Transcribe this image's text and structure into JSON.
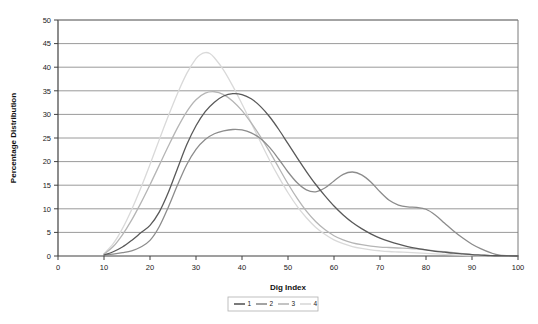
{
  "chart_data": {
    "type": "line",
    "title": "",
    "xlabel": "Dig Index",
    "ylabel": "Percentage Distribution",
    "xlim": [
      0,
      100
    ],
    "ylim": [
      0,
      50
    ],
    "xticks": [
      0,
      10,
      20,
      30,
      40,
      50,
      60,
      70,
      80,
      90,
      100
    ],
    "yticks": [
      0,
      5,
      10,
      15,
      20,
      25,
      30,
      35,
      40,
      45,
      50
    ],
    "grid": "horizontal",
    "legend_position": "bottom-center",
    "series": [
      {
        "name": "1",
        "color": "#595959",
        "points": [
          [
            10,
            0.2
          ],
          [
            12,
            0.9
          ],
          [
            14,
            1.9
          ],
          [
            16,
            3.3
          ],
          [
            18,
            4.9
          ],
          [
            20,
            6.5
          ],
          [
            22,
            9.3
          ],
          [
            24,
            13.5
          ],
          [
            26,
            18.6
          ],
          [
            28,
            23.6
          ],
          [
            30,
            27.6
          ],
          [
            32,
            30.6
          ],
          [
            34,
            32.6
          ],
          [
            36,
            33.9
          ],
          [
            38,
            34.4
          ],
          [
            40,
            34.2
          ],
          [
            42,
            33.3
          ],
          [
            44,
            31.7
          ],
          [
            46,
            29.5
          ],
          [
            48,
            26.8
          ],
          [
            50,
            23.8
          ],
          [
            52,
            20.8
          ],
          [
            54,
            17.9
          ],
          [
            56,
            15.2
          ],
          [
            58,
            12.8
          ],
          [
            60,
            10.6
          ],
          [
            62,
            8.7
          ],
          [
            64,
            7.1
          ],
          [
            66,
            5.8
          ],
          [
            68,
            4.7
          ],
          [
            70,
            3.8
          ],
          [
            72,
            3.1
          ],
          [
            74,
            2.5
          ],
          [
            76,
            2.0
          ],
          [
            78,
            1.6
          ],
          [
            80,
            1.3
          ],
          [
            82,
            1.0
          ],
          [
            84,
            0.8
          ],
          [
            86,
            0.6
          ],
          [
            88,
            0.45
          ],
          [
            90,
            0.3
          ],
          [
            92,
            0.2
          ],
          [
            94,
            0.1
          ],
          [
            96,
            0.05
          ],
          [
            100,
            0.0
          ]
        ]
      },
      {
        "name": "2",
        "color": "#8c8c8c",
        "points": [
          [
            10,
            0.2
          ],
          [
            12,
            0.4
          ],
          [
            14,
            0.7
          ],
          [
            16,
            1.1
          ],
          [
            18,
            1.9
          ],
          [
            20,
            3.3
          ],
          [
            22,
            6.2
          ],
          [
            24,
            10.4
          ],
          [
            26,
            15.1
          ],
          [
            28,
            19.4
          ],
          [
            30,
            22.6
          ],
          [
            32,
            24.7
          ],
          [
            34,
            25.9
          ],
          [
            36,
            26.5
          ],
          [
            38,
            26.8
          ],
          [
            40,
            26.7
          ],
          [
            42,
            26.1
          ],
          [
            44,
            24.9
          ],
          [
            46,
            23.0
          ],
          [
            48,
            20.5
          ],
          [
            50,
            17.8
          ],
          [
            52,
            15.5
          ],
          [
            54,
            14.0
          ],
          [
            56,
            13.6
          ],
          [
            58,
            14.4
          ],
          [
            60,
            15.9
          ],
          [
            62,
            17.3
          ],
          [
            64,
            17.8
          ],
          [
            66,
            17.2
          ],
          [
            68,
            15.7
          ],
          [
            70,
            13.6
          ],
          [
            72,
            11.8
          ],
          [
            74,
            10.8
          ],
          [
            76,
            10.4
          ],
          [
            78,
            10.3
          ],
          [
            80,
            9.9
          ],
          [
            82,
            8.7
          ],
          [
            84,
            7.0
          ],
          [
            86,
            5.3
          ],
          [
            88,
            3.8
          ],
          [
            90,
            2.5
          ],
          [
            92,
            1.5
          ],
          [
            94,
            0.7
          ],
          [
            96,
            0.2
          ],
          [
            100,
            0.0
          ]
        ]
      },
      {
        "name": "3",
        "color": "#b5b5b5",
        "points": [
          [
            10,
            0.4
          ],
          [
            12,
            2.0
          ],
          [
            14,
            4.5
          ],
          [
            16,
            7.6
          ],
          [
            18,
            11.2
          ],
          [
            20,
            15.1
          ],
          [
            22,
            19.2
          ],
          [
            24,
            23.3
          ],
          [
            26,
            27.2
          ],
          [
            28,
            30.6
          ],
          [
            30,
            33.1
          ],
          [
            32,
            34.5
          ],
          [
            34,
            34.8
          ],
          [
            36,
            34.2
          ],
          [
            38,
            32.8
          ],
          [
            40,
            30.8
          ],
          [
            42,
            28.2
          ],
          [
            44,
            25.3
          ],
          [
            46,
            22.1
          ],
          [
            48,
            18.7
          ],
          [
            50,
            15.3
          ],
          [
            52,
            12.2
          ],
          [
            54,
            9.5
          ],
          [
            56,
            7.3
          ],
          [
            58,
            5.6
          ],
          [
            60,
            4.3
          ],
          [
            62,
            3.4
          ],
          [
            64,
            2.8
          ],
          [
            66,
            2.4
          ],
          [
            68,
            2.1
          ],
          [
            70,
            1.9
          ],
          [
            72,
            1.8
          ],
          [
            74,
            1.7
          ],
          [
            76,
            1.6
          ],
          [
            78,
            1.5
          ],
          [
            80,
            1.3
          ],
          [
            82,
            1.1
          ],
          [
            84,
            0.9
          ],
          [
            86,
            0.7
          ],
          [
            88,
            0.5
          ],
          [
            90,
            0.3
          ],
          [
            92,
            0.15
          ],
          [
            94,
            0.05
          ],
          [
            96,
            0.0
          ],
          [
            100,
            0.0
          ]
        ]
      },
      {
        "name": "4",
        "color": "#d9d9d9",
        "points": [
          [
            10,
            0.5
          ],
          [
            12,
            2.6
          ],
          [
            14,
            5.8
          ],
          [
            16,
            9.8
          ],
          [
            18,
            14.4
          ],
          [
            20,
            19.4
          ],
          [
            22,
            24.6
          ],
          [
            24,
            29.7
          ],
          [
            26,
            34.5
          ],
          [
            28,
            38.7
          ],
          [
            30,
            41.8
          ],
          [
            31,
            42.7
          ],
          [
            32,
            43.1
          ],
          [
            33,
            42.9
          ],
          [
            34,
            42.0
          ],
          [
            36,
            39.4
          ],
          [
            38,
            36.0
          ],
          [
            40,
            32.2
          ],
          [
            42,
            28.2
          ],
          [
            44,
            24.2
          ],
          [
            46,
            20.3
          ],
          [
            48,
            16.7
          ],
          [
            50,
            13.4
          ],
          [
            52,
            10.5
          ],
          [
            54,
            8.1
          ],
          [
            56,
            6.1
          ],
          [
            58,
            4.6
          ],
          [
            60,
            3.4
          ],
          [
            62,
            2.6
          ],
          [
            64,
            2.0
          ],
          [
            66,
            1.6
          ],
          [
            68,
            1.3
          ],
          [
            70,
            1.1
          ],
          [
            72,
            0.95
          ],
          [
            74,
            0.85
          ],
          [
            76,
            0.75
          ],
          [
            78,
            0.65
          ],
          [
            80,
            0.55
          ],
          [
            82,
            0.45
          ],
          [
            84,
            0.35
          ],
          [
            86,
            0.25
          ],
          [
            88,
            0.15
          ],
          [
            90,
            0.08
          ],
          [
            92,
            0.03
          ],
          [
            94,
            0.0
          ],
          [
            100,
            0.0
          ]
        ]
      }
    ]
  },
  "axes": {
    "y_title": "Percentage Distribution",
    "x_title": "Dig Index",
    "y_tick_labels": [
      "0",
      "5",
      "10",
      "15",
      "20",
      "25",
      "30",
      "35",
      "40",
      "45",
      "50"
    ],
    "x_tick_labels": [
      "0",
      "10",
      "20",
      "30",
      "40",
      "50",
      "60",
      "70",
      "80",
      "90",
      "100"
    ]
  },
  "legend": {
    "entries": [
      {
        "label": "1",
        "color": "#595959"
      },
      {
        "label": "2",
        "color": "#8c8c8c"
      },
      {
        "label": "3",
        "color": "#b5b5b5"
      },
      {
        "label": "4",
        "color": "#d9d9d9"
      }
    ]
  },
  "style": {
    "plot_background": "#ffffff",
    "grid_color": "#808080",
    "axis_color": "#404040",
    "text_color": "#1a1a1a",
    "legend_border": "#b0b0b0"
  }
}
